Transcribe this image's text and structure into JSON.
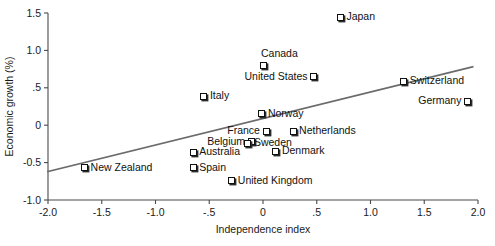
{
  "chart_data": {
    "type": "scatter",
    "title": "",
    "xlabel": "Independence index",
    "ylabel": "Economic growth (%)",
    "xlim": [
      -2.0,
      2.0
    ],
    "ylim": [
      -1.0,
      1.5
    ],
    "xticks": [
      "-2.0",
      "-1.5",
      "-1.0",
      "-.5",
      "0",
      ".5",
      "1.0",
      "1.5",
      "2.0"
    ],
    "xtick_values": [
      -2.0,
      -1.5,
      -1.0,
      -0.5,
      0,
      0.5,
      1.0,
      1.5,
      2.0
    ],
    "yticks": [
      "1.5",
      "1.0",
      ".5",
      "0",
      "-0.5",
      "-1.0"
    ],
    "ytick_values": [
      1.5,
      1.0,
      0.5,
      0,
      -0.5,
      -1.0
    ],
    "grid": false,
    "legend": "none",
    "marker_style": "open-square-with-shadow",
    "trend_line": {
      "name": "regression-line",
      "x0": -2.0,
      "y0": -0.62,
      "x1": 1.95,
      "y1": 0.78,
      "color": "#6b6b6b"
    },
    "points": [
      {
        "label": "Japan",
        "x": 0.72,
        "y": 1.44,
        "label_side": "right"
      },
      {
        "label": "Canada",
        "x": 0.0,
        "y": 0.8,
        "label_side": "above"
      },
      {
        "label": "United States",
        "x": 0.47,
        "y": 0.65,
        "label_side": "left"
      },
      {
        "label": "Switzerland",
        "x": 1.31,
        "y": 0.59,
        "label_side": "right"
      },
      {
        "label": "Germany",
        "x": 1.9,
        "y": 0.32,
        "label_side": "left"
      },
      {
        "label": "Italy",
        "x": -0.55,
        "y": 0.39,
        "label_side": "right"
      },
      {
        "label": "Norway",
        "x": -0.01,
        "y": 0.15,
        "label_side": "right"
      },
      {
        "label": "France",
        "x": 0.03,
        "y": -0.08,
        "label_side": "left"
      },
      {
        "label": "Netherlands",
        "x": 0.28,
        "y": -0.08,
        "label_side": "right"
      },
      {
        "label": "Belgium",
        "x": -0.11,
        "y": -0.22,
        "label_side": "left"
      },
      {
        "label": "Sweden",
        "x": -0.14,
        "y": -0.24,
        "label_side": "right"
      },
      {
        "label": "Australia",
        "x": -0.65,
        "y": -0.36,
        "label_side": "right"
      },
      {
        "label": "Denmark",
        "x": 0.12,
        "y": -0.35,
        "label_side": "right"
      },
      {
        "label": "Spain",
        "x": -0.65,
        "y": -0.57,
        "label_side": "right"
      },
      {
        "label": "New Zealand",
        "x": -1.66,
        "y": -0.57,
        "label_side": "right"
      },
      {
        "label": "United Kingdom",
        "x": -0.29,
        "y": -0.74,
        "label_side": "right"
      }
    ]
  },
  "colors": {
    "axis": "#4a4a4a",
    "trend": "#6b6b6b",
    "marker_border": "#111111",
    "marker_shadow": "#2b2b2b",
    "text": "#111111",
    "background": "#ffffff"
  }
}
